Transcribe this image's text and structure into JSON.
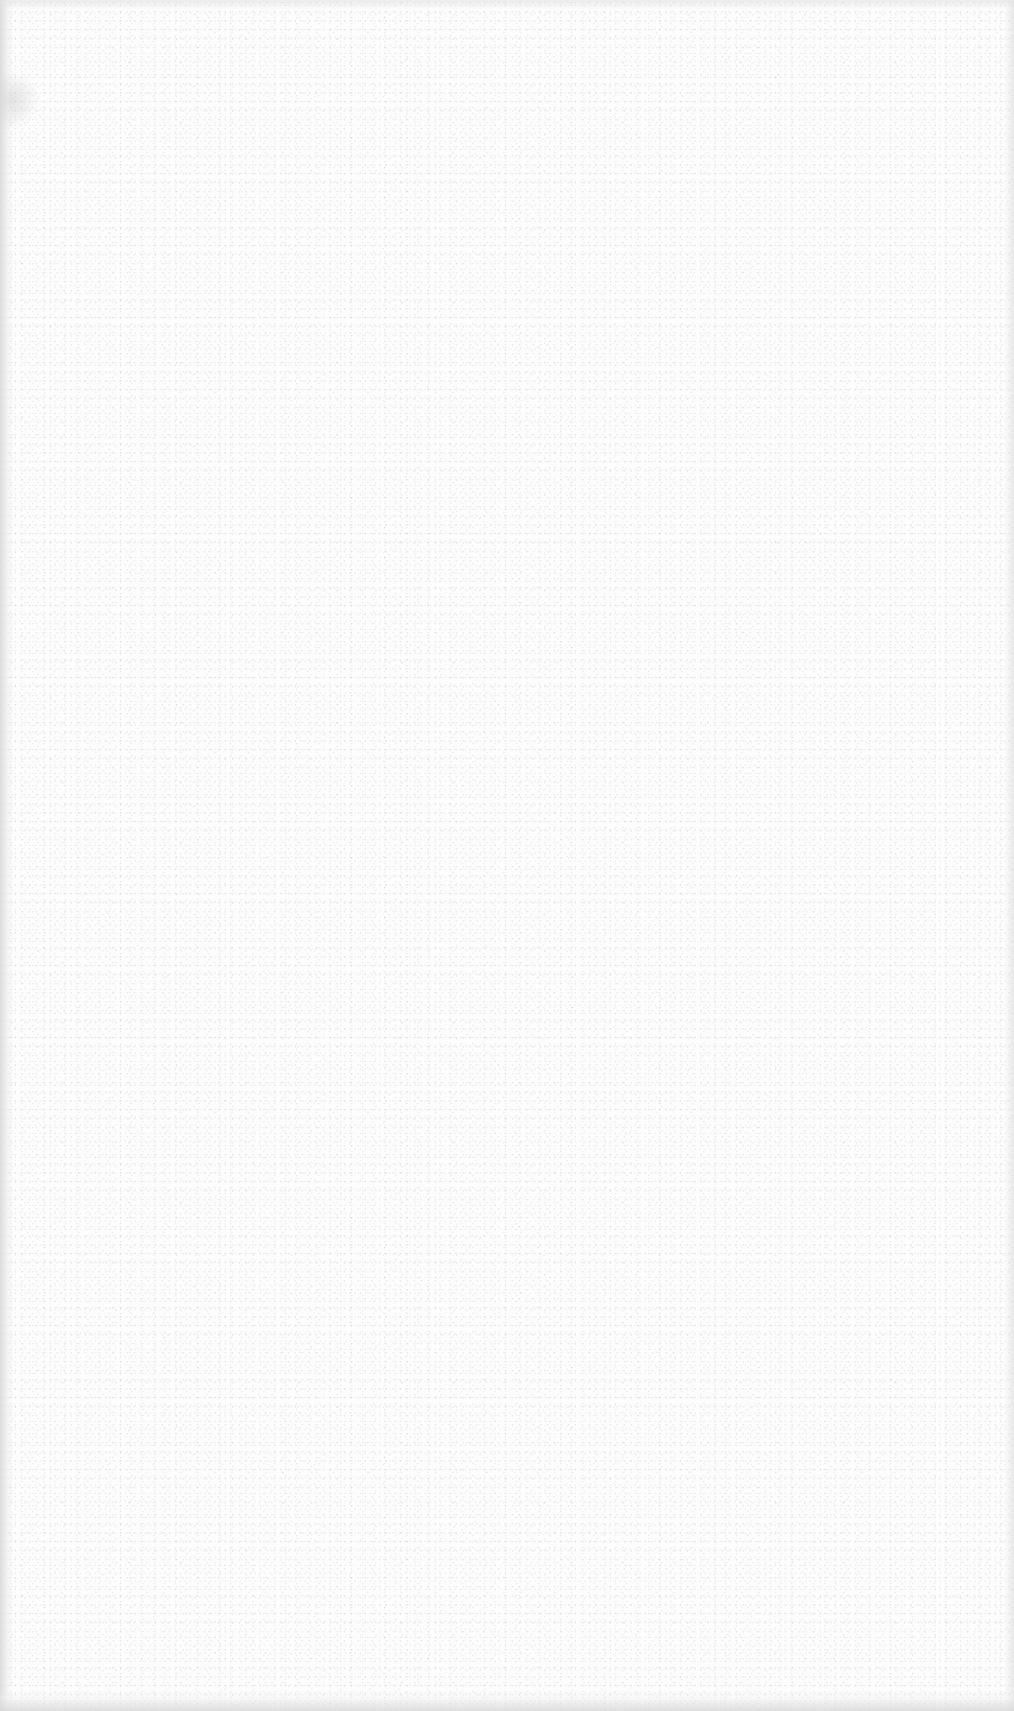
{
  "page": {
    "type": "blank-scanned-page",
    "background_color": "#fdfdfd",
    "texture": "paper-speckle-noise",
    "content": []
  }
}
